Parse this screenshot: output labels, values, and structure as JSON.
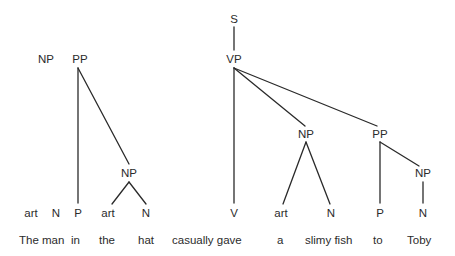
{
  "diagram": {
    "type": "syntax-tree",
    "nodes": {
      "s": "S",
      "vp": "VP",
      "np_subject": "NP",
      "pp_subject": "PP",
      "np_in": "NP",
      "np_object": "NP",
      "pp_to": "PP",
      "np_toby": "NP"
    },
    "categories": [
      {
        "id": "art1",
        "label": "art"
      },
      {
        "id": "n1",
        "label": "N"
      },
      {
        "id": "p1",
        "label": "P"
      },
      {
        "id": "art2",
        "label": "art"
      },
      {
        "id": "n2",
        "label": "N"
      },
      {
        "id": "v",
        "label": "V"
      },
      {
        "id": "art3",
        "label": "art"
      },
      {
        "id": "n3",
        "label": "N"
      },
      {
        "id": "p2",
        "label": "P"
      },
      {
        "id": "n4",
        "label": "N"
      }
    ],
    "words": [
      "The",
      "man",
      "in",
      "the",
      "hat",
      "casually",
      "gave",
      "a",
      "slimy",
      "fish",
      "to",
      "Toby"
    ],
    "word_groups": [
      {
        "text": "The man"
      },
      {
        "text": "in"
      },
      {
        "text": "the"
      },
      {
        "text": "hat"
      },
      {
        "text": "casually gave"
      },
      {
        "text": "a"
      },
      {
        "text": "slimy fish"
      },
      {
        "text": "to"
      },
      {
        "text": "Toby"
      }
    ],
    "line_color": "#2a2a2a"
  }
}
